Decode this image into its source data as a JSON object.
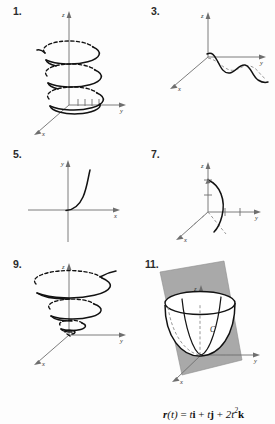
{
  "page": {
    "background_color": "#fdfdfd",
    "width": 275,
    "height": 424
  },
  "problems": [
    {
      "number": "1.",
      "figure_name": "helix-3d-graph",
      "axes": [
        "z",
        "y",
        "x"
      ],
      "description": "Three-dimensional circular helix winding upward around the z-axis with dashed hidden back arcs, tick marks along the y-axis"
    },
    {
      "number": "3.",
      "figure_name": "wavy-curve-3d-graph",
      "axes": [
        "z",
        "y",
        "x"
      ],
      "description": "Oscillating sinusoidal space curve descending along the y-axis with a dashed shadow projection"
    },
    {
      "number": "5.",
      "figure_name": "exponential-2d-graph",
      "axes": [
        "y",
        "x"
      ],
      "description": "Two-dimensional plane curve rising steeply like an exponential in the first quadrant"
    },
    {
      "number": "7.",
      "figure_name": "arc-3d-graph",
      "axes": [
        "z",
        "y",
        "x"
      ],
      "description": "Quarter-circle style arc in a vertical plane from the z-axis down past the origin, ticks on z and y axes"
    },
    {
      "number": "9.",
      "figure_name": "converging-spiral-3d-graph",
      "axes": [
        "z",
        "y",
        "x"
      ],
      "description": "Spiral that shrinks as it descends toward the origin with dashed hidden back arcs"
    },
    {
      "number": "11.",
      "figure_name": "paraboloid-plane-3d-graph",
      "axes": [
        "z",
        "y",
        "x"
      ],
      "curve_label": "C",
      "plane_color": "#a9a9a9",
      "description": "Parabolic cup (paraboloid) intersected by a shaded vertical plane; intersection curve labeled C"
    }
  ],
  "equation": {
    "lhs_bold": "r",
    "full_text": "r(t) = ti + tj + 2t²k",
    "parts": {
      "r": "r",
      "of_t": "(t)",
      "equals": "=",
      "term1_coef": "t",
      "term1_unit": "i",
      "plus1": "+",
      "term2_coef": "t",
      "term2_unit": "j",
      "plus2": "+",
      "term3_coef": "2t",
      "term3_exp": "2",
      "term3_unit": "k"
    }
  }
}
